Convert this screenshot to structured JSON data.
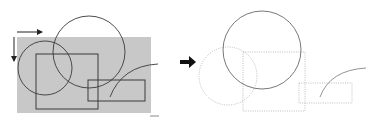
{
  "diagram": {
    "colors": {
      "background": "#ffffff",
      "clip_region_fill": "#c8c8c8",
      "stroke": "#3a3a3a",
      "faded_stroke": "#b0b0b0",
      "arrow": "#111111"
    },
    "left_panel": {
      "clip_region": {
        "x": 17,
        "y": 37,
        "w": 134,
        "h": 76
      },
      "large_circle": {
        "cx": 89,
        "cy": 52,
        "r": 36
      },
      "small_circle": {
        "cx": 45,
        "cy": 68,
        "r": 27
      },
      "rect_a": {
        "x": 36,
        "y": 54,
        "w": 62,
        "h": 55
      },
      "rect_b": {
        "x": 88,
        "y": 80,
        "w": 57,
        "h": 21
      },
      "arc": {
        "d": "M110 97 Q 122 66 158 64"
      },
      "direction_arrows": [
        "horizontal-right",
        "vertical-down"
      ]
    },
    "transform_arrow": "right-arrow",
    "right_panel": {
      "large_circle": {
        "cx": 262,
        "cy": 50,
        "r": 39,
        "style": "solid"
      },
      "small_circle": {
        "cx": 228,
        "cy": 76,
        "r": 29,
        "style": "dotted"
      },
      "rect_a": {
        "x": 243,
        "y": 52,
        "w": 62,
        "h": 59,
        "style": "dotted"
      },
      "rect_b": {
        "x": 299,
        "y": 83,
        "w": 53,
        "h": 20,
        "style": "dotted"
      },
      "arc": {
        "d": "M320 97 Q 330 70 366 68",
        "style": "solid"
      }
    }
  }
}
